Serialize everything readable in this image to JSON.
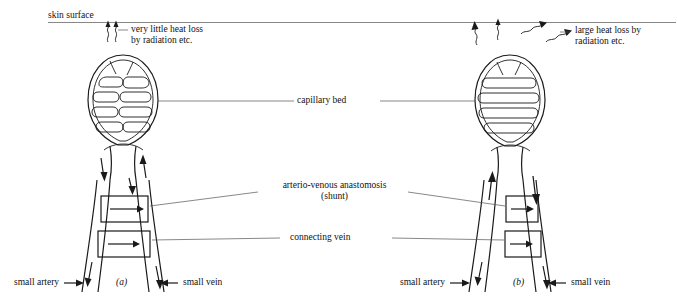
{
  "figure": {
    "title_absent": "",
    "labels": {
      "skin_surface": "skin surface",
      "very_little_heat_loss": "very little heat loss\nby radiation etc.",
      "large_heat_loss": "large heat loss by\nradiation etc.",
      "capillary_bed": "capillary bed",
      "anastomosis": "arterio-venous anastomosis\n(shunt)",
      "connecting_vein": "connecting vein",
      "small_artery_left": "small artery",
      "small_vein_left": "small vein",
      "small_artery_right": "small artery",
      "small_vein_right": "small vein",
      "panel_a": "(a)",
      "panel_b": "(b)"
    },
    "colors": {
      "ink": "#1a1a1a",
      "hairline": "#555555",
      "background": "#ffffff"
    },
    "panels": [
      {
        "id": "a",
        "caption": "(a)",
        "state": "vasoconstricted, shunt open, little blood to capillary bed",
        "heat_loss": "very little"
      },
      {
        "id": "b",
        "caption": "(b)",
        "state": "vasodilated, capillary bed perfused",
        "heat_loss": "large"
      }
    ]
  }
}
